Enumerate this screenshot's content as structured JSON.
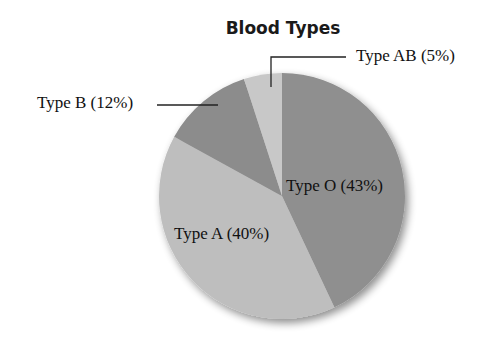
{
  "chart_data": {
    "type": "pie",
    "title": "Blood Types",
    "categories": [
      "Type O",
      "Type A",
      "Type B",
      "Type AB"
    ],
    "values": [
      43,
      40,
      12,
      5
    ],
    "labels": [
      "Type O (43%)",
      "Type A (40%)",
      "Type B (12%)",
      "Type AB (5%)"
    ],
    "colors": [
      "#8f8f8f",
      "#bebebe",
      "#8c8c8c",
      "#c8c8c8"
    ],
    "start_angle": "12 o'clock",
    "direction": "clockwise",
    "legend": "none (inline labels with leader lines for Type B and Type AB)"
  },
  "layout": {
    "cx": 282,
    "cy": 196,
    "r": 123
  }
}
